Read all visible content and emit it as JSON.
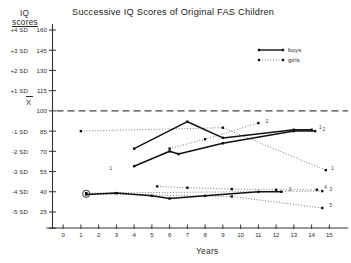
{
  "chart_data": {
    "type": "line",
    "title": "Successive IQ Scores of Original FAS Children",
    "xlabel": "Years",
    "ylabel": "IQ scores",
    "ylabel_line1": "IQ",
    "ylabel_line2": "scores",
    "xlim": [
      -0.6,
      15.6
    ],
    "ylim": [
      18,
      167
    ],
    "grid": false,
    "legend_position": "top-right",
    "mean_line": {
      "value": 100,
      "label": "X",
      "style": "dashed"
    },
    "y_ticks": [
      {
        "iq": 160,
        "sd": "+4 SD"
      },
      {
        "iq": 145,
        "sd": "+3 SD"
      },
      {
        "iq": 130,
        "sd": "+2 SD"
      },
      {
        "iq": 115,
        "sd": "+1 SD"
      },
      {
        "iq": 100,
        "sd": "X"
      },
      {
        "iq": 85,
        "sd": "-1 SD"
      },
      {
        "iq": 70,
        "sd": "-2 SD"
      },
      {
        "iq": 55,
        "sd": "-3 SD"
      },
      {
        "iq": 40,
        "sd": "-4 SD"
      },
      {
        "iq": 25,
        "sd": "-5 SD"
      }
    ],
    "x_ticks": [
      0,
      1,
      2,
      3,
      4,
      5,
      6,
      7,
      8,
      9,
      10,
      11,
      12,
      13,
      14,
      15
    ],
    "legend": [
      {
        "name": "boys",
        "style": "solid"
      },
      {
        "name": "girls",
        "style": "dotted"
      }
    ],
    "series": [
      {
        "name": "girls-1",
        "sex": "girls",
        "style": "dotted",
        "label": "1",
        "points": [
          [
            1.0,
            85
          ],
          [
            9.0,
            87.5
          ],
          [
            14.8,
            56
          ]
        ]
      },
      {
        "name": "girls-2",
        "sex": "girls",
        "style": "dotted",
        "label": "2",
        "points": [
          [
            6.0,
            72
          ],
          [
            8.0,
            79
          ],
          [
            11.0,
            91
          ]
        ]
      },
      {
        "name": "girls-3",
        "sex": "girls",
        "style": "dotted",
        "label": "3",
        "points": [
          [
            1.3,
            39
          ],
          [
            14.6,
            40.5
          ]
        ]
      },
      {
        "name": "girls-4",
        "sex": "girls",
        "style": "dotted",
        "label": "4",
        "points": [
          [
            5.3,
            44
          ],
          [
            7.0,
            43
          ],
          [
            9.5,
            42
          ],
          [
            12.0,
            41.5
          ],
          [
            14.3,
            41.5
          ]
        ]
      },
      {
        "name": "girls-5",
        "sex": "girls",
        "style": "dotted",
        "label": "5",
        "points": [
          [
            1.3,
            38.5
          ],
          [
            9.5,
            36.5
          ],
          [
            14.6,
            28
          ]
        ]
      },
      {
        "name": "boys-1",
        "sex": "boys",
        "style": "solid",
        "label": "1",
        "points": [
          [
            4.0,
            72
          ],
          [
            7.0,
            92
          ],
          [
            9.0,
            80
          ],
          [
            13.0,
            86
          ],
          [
            14.0,
            86
          ]
        ]
      },
      {
        "name": "boys-2",
        "sex": "boys",
        "style": "solid",
        "label": "2",
        "points": [
          [
            4.0,
            59
          ],
          [
            6.0,
            70
          ],
          [
            6.5,
            68
          ],
          [
            9.0,
            76
          ],
          [
            13.0,
            85
          ],
          [
            14.2,
            85
          ]
        ]
      },
      {
        "name": "boys-3",
        "sex": "boys",
        "style": "solid",
        "label": "3",
        "points": [
          [
            1.3,
            38
          ],
          [
            3.0,
            39
          ],
          [
            5.0,
            37
          ],
          [
            6.0,
            35
          ],
          [
            8.0,
            37
          ],
          [
            11.0,
            40
          ],
          [
            12.3,
            40
          ]
        ]
      }
    ],
    "point_labels": [
      {
        "text": "1",
        "x": 15.0,
        "y": 56
      },
      {
        "text": "2",
        "x": 11.3,
        "y": 91
      },
      {
        "text": "3",
        "x": 14.9,
        "y": 40.5
      },
      {
        "text": "4",
        "x": 14.6,
        "y": 41.5
      },
      {
        "text": "5",
        "x": 14.9,
        "y": 28
      },
      {
        "text": "1",
        "x": 14.3,
        "y": 86
      },
      {
        "text": "2",
        "x": 14.5,
        "y": 85
      },
      {
        "text": "3",
        "x": 12.6,
        "y": 40
      },
      {
        "text": "1",
        "x": 2.5,
        "y": 56
      }
    ],
    "annotations": [
      {
        "type": "circled-point",
        "x": 1.3,
        "y": 38.5,
        "note": "circled marker"
      }
    ]
  }
}
